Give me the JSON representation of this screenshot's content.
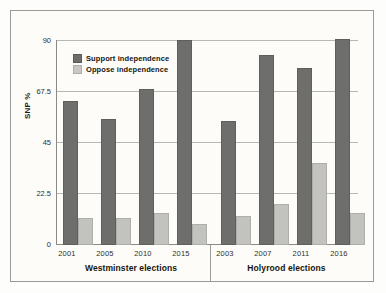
{
  "chart_data": {
    "type": "bar",
    "title": "",
    "subtitle": "",
    "xlabel": "",
    "ylabel": "SNP %",
    "ylim": [
      0,
      90
    ],
    "yticks": [
      "0",
      "22.5",
      "45",
      "67.5",
      "90"
    ],
    "ytick_values": [
      0,
      22.5,
      45,
      67.5,
      90
    ],
    "grid": true,
    "legend_position": "top-left",
    "categories": [
      "2001",
      "2005",
      "2010",
      "2015",
      "2003",
      "2007",
      "2011",
      "2016"
    ],
    "groups": [
      {
        "name": "Westminster elections",
        "categories": [
          "2001",
          "2005",
          "2010",
          "2015"
        ]
      },
      {
        "name": "Holyrood elections",
        "categories": [
          "2003",
          "2007",
          "2011",
          "2016"
        ]
      }
    ],
    "series": [
      {
        "name": "Support independence",
        "color": "#6e6e6c",
        "values": [
          62.5,
          54.5,
          67.5,
          89.0,
          53.5,
          82.5,
          77.0,
          89.5
        ]
      },
      {
        "name": "Oppose independence",
        "color": "#c2c2be",
        "values": [
          11.0,
          11.0,
          13.0,
          8.5,
          12.0,
          17.0,
          35.0,
          13.0
        ]
      }
    ]
  },
  "legend": {
    "items": [
      {
        "label": "Support independence",
        "key": "support"
      },
      {
        "label": "Oppose independence",
        "key": "oppose"
      }
    ]
  },
  "axis": {
    "y_title": "SNP %",
    "y_ticks": [
      "90",
      "67.5",
      "45",
      "22.5",
      "0"
    ]
  },
  "group_titles": {
    "westminster": "Westminster elections",
    "holyrood": "Holyrood elections"
  },
  "x_labels": {
    "w1": "2001",
    "w2": "2005",
    "w3": "2010",
    "w4": "2015",
    "h1": "2003",
    "h2": "2007",
    "h3": "2011",
    "h4": "2016"
  },
  "colors": {
    "support": "#6e6e6c",
    "oppose": "#c2c2be",
    "grid": "#b9b9b4",
    "axis": "#8a8a86",
    "background": "#fdfcf8",
    "frame": "#9a9a96"
  }
}
